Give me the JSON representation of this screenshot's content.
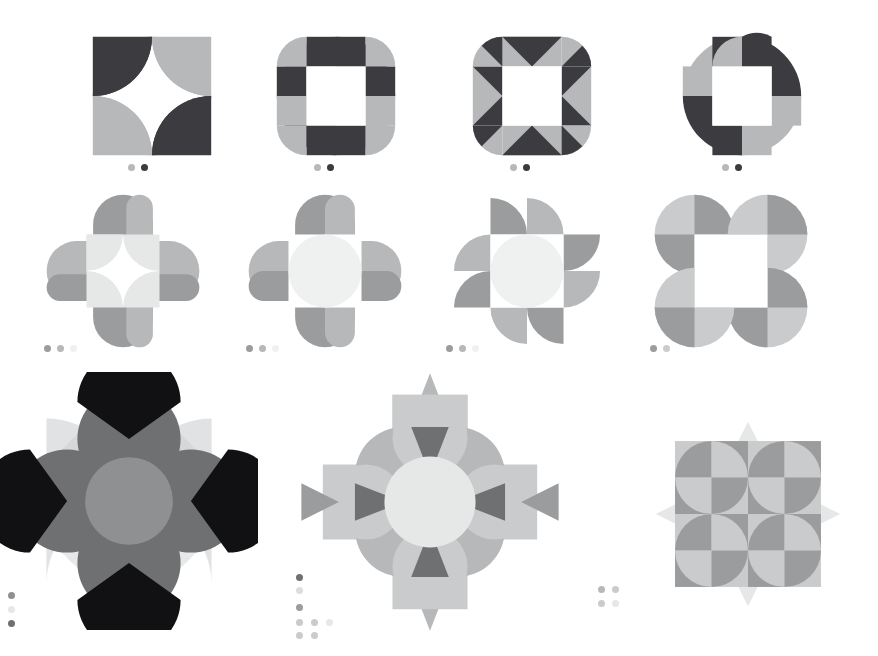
{
  "artboard": {
    "title": "Geometric Ornament Pattern Sheet",
    "width": 878,
    "height": 656,
    "background": "#ffffff",
    "rows": 3,
    "pattern_count": 11
  },
  "palette": {
    "dark": "#3c3c40",
    "near_black": "#111114",
    "mid_dark": "#6f7072",
    "mid": "#8e9092",
    "mid_gray": "#9a9c9e",
    "light_gray": "#b6b8b9",
    "lighter_gray": "#c9cbcc",
    "pale": "#dcdedd",
    "paler": "#e6e8e7",
    "palest": "#eff1f0",
    "white": "#ffffff"
  },
  "patterns": [
    {
      "id": "p1",
      "name": "pinwheel-leaf-two-tone",
      "row": 1,
      "column": 1,
      "x": 78,
      "y": 22,
      "size": 148,
      "description": "Four leaf petals rotating around an open square center, alternating dark and light gray",
      "colors": [
        "#3c3c40",
        "#b6b8b9"
      ],
      "swatches": [
        "#b6b8b9",
        "#3c3c40"
      ],
      "swatch_x": 128,
      "swatch_y": 164
    },
    {
      "id": "p2",
      "name": "quatrefoil-checker-petals",
      "row": 1,
      "column": 2,
      "x": 262,
      "y": 22,
      "size": 148,
      "description": "Four quarter-circle petals each split into dark and light halves around a white square",
      "colors": [
        "#3c3c40",
        "#b6b8b9"
      ],
      "swatches": [
        "#b6b8b9",
        "#3c3c40"
      ],
      "swatch_x": 314,
      "swatch_y": 164
    },
    {
      "id": "p3",
      "name": "triangular-fan-star",
      "row": 1,
      "column": 3,
      "x": 458,
      "y": 22,
      "size": 148,
      "description": "Petals subdivided by diagonals into light and dark triangles forming a star burst",
      "colors": [
        "#3c3c40",
        "#b6b8b9"
      ],
      "swatches": [
        "#b6b8b9",
        "#3c3c40"
      ],
      "swatch_x": 510,
      "swatch_y": 164
    },
    {
      "id": "p4",
      "name": "quarter-circle-pinwheel",
      "row": 1,
      "column": 4,
      "x": 668,
      "y": 22,
      "size": 148,
      "description": "Four large quarter discs in pinwheel rotation with checkered dark and light quadrants",
      "colors": [
        "#3c3c40",
        "#b6b8b9"
      ],
      "swatches": [
        "#b6b8b9",
        "#3c3c40"
      ],
      "swatch_x": 722,
      "swatch_y": 164
    },
    {
      "id": "p5",
      "name": "rounded-cross-star-center",
      "row": 2,
      "column": 1,
      "x": 40,
      "y": 188,
      "size": 166,
      "description": "Four rounded lobes around a pale square containing a concave four pointed star",
      "colors": [
        "#9a9c9e",
        "#b6b8b9",
        "#e6e8e7",
        "#ffffff"
      ],
      "swatches": [
        "#9a9c9e",
        "#b6b8b9",
        "#eff1f0"
      ],
      "swatch_x": 44,
      "swatch_y": 345
    },
    {
      "id": "p6",
      "name": "rounded-cross-disc-center",
      "row": 2,
      "column": 2,
      "x": 242,
      "y": 188,
      "size": 166,
      "description": "Four rounded lobes around a white square holding a pale circle",
      "colors": [
        "#9a9c9e",
        "#b6b8b9",
        "#e6e8e7",
        "#ffffff"
      ],
      "swatches": [
        "#9a9c9e",
        "#b6b8b9",
        "#eff1f0"
      ],
      "swatch_x": 246,
      "swatch_y": 345
    },
    {
      "id": "p7",
      "name": "spiral-petal-disc",
      "row": 2,
      "column": 3,
      "x": 444,
      "y": 188,
      "size": 166,
      "description": "Eight quarter circle petals spiralling around a pale central disc",
      "colors": [
        "#9a9c9e",
        "#b6b8b9",
        "#e6e8e7"
      ],
      "swatches": [
        "#9a9c9e",
        "#b6b8b9",
        "#eff1f0"
      ],
      "swatch_x": 446,
      "swatch_y": 345
    },
    {
      "id": "p8",
      "name": "four-disc-open-square",
      "row": 2,
      "column": 4,
      "x": 648,
      "y": 188,
      "size": 166,
      "description": "Four corner circles with alternating light quadrants framing an open white square",
      "colors": [
        "#9a9c9e",
        "#c9cbcc",
        "#e6e8e7"
      ],
      "swatches": [
        "#9a9c9e",
        "#c9cbcc"
      ],
      "swatch_x": 650,
      "swatch_y": 345
    },
    {
      "id": "p9",
      "name": "overlapping-disc-rosette",
      "row": 3,
      "column": 1,
      "x": 0,
      "y": 372,
      "size": 258,
      "description": "Overlapping discs with black and gray wedges over pale fan shapes with a gray core disc",
      "colors": [
        "#111114",
        "#6f7072",
        "#8e9092",
        "#c9cbcc",
        "#e6e8e7"
      ],
      "swatches": [
        "#8e9092",
        "#e6e8e7",
        "#6f7072"
      ],
      "swatch_x": 8,
      "swatch_y": 592,
      "swatch_layout": "vertical"
    },
    {
      "id": "p10",
      "name": "rounded-square-petal-medallion",
      "row": 3,
      "column": 2,
      "x": 296,
      "y": 368,
      "size": 268,
      "description": "Rounded square body with four pointed petals, dark triangle accents and a pale center disc",
      "colors": [
        "#6f7072",
        "#9a9c9e",
        "#b6b8b9",
        "#c9cbcc",
        "#e6e8e7"
      ],
      "swatches": [
        "#6f7072",
        "#dcdedd",
        "#9a9c9e",
        "#c9cbcc",
        "#c9cbcc",
        "#e6e8e7",
        "#c9cbcc",
        "#c9cbcc"
      ],
      "swatch_x": 296,
      "swatch_y": 574,
      "swatch_layout": "pyramid"
    },
    {
      "id": "p11",
      "name": "quarter-circle-grid-star",
      "row": 3,
      "column": 3,
      "x": 652,
      "y": 418,
      "size": 192,
      "description": "Four by four grid of quarter circle tiles with pale spikes radiating from each side",
      "colors": [
        "#9a9c9e",
        "#b6b8b9",
        "#c9cbcc",
        "#e6e8e7"
      ],
      "swatches": [
        "#b6b8b9",
        "#c9cbcc",
        "#c9cbcc",
        "#e6e8e7"
      ],
      "swatch_x": 598,
      "swatch_y": 586,
      "swatch_layout": "grid2x2"
    }
  ]
}
